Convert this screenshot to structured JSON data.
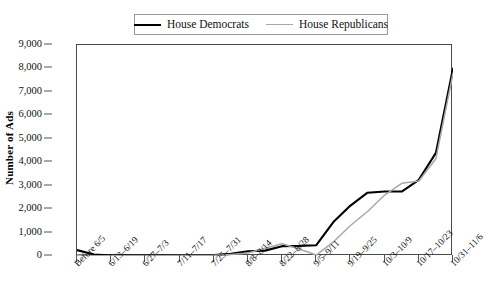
{
  "chart_data": {
    "type": "line",
    "title": "",
    "xlabel": "",
    "ylabel": "Number of Ads",
    "ylim": [
      0,
      9000
    ],
    "ytick_step": 1000,
    "grid": false,
    "legend_position": "top-center",
    "yticks": [
      "9,000",
      "8,000",
      "7,000",
      "6,000",
      "5,000",
      "4,000",
      "3,000",
      "2,000",
      "1,000",
      "0"
    ],
    "ytick_values": [
      9000,
      8000,
      7000,
      6000,
      5000,
      4000,
      3000,
      2000,
      1000,
      0
    ],
    "categories": [
      "Before 6/5",
      "6/6-6/12",
      "6/13-6/19",
      "6/20-6/26",
      "6/27-7/3",
      "7/4-7/10",
      "7/11-7/17",
      "7/18-7/24",
      "7/25-7/31",
      "8/1-8/7",
      "8/8-8/14",
      "8/15-8/21",
      "8/22-8/28",
      "8/29-9/4",
      "9/5-9/11",
      "9/12-9/18",
      "9/19-9/25",
      "9/26-10/2",
      "10/3-10/9",
      "10/10-10/16",
      "10/17-10/23",
      "10/24-10/30",
      "10/31-11/6"
    ],
    "xtick_labels": [
      "Before 6/5",
      "6/13-6/19",
      "6/27-7/3",
      "7/11-7/17",
      "7/25-7/31",
      "8/8-8/14",
      "8/22-8/28",
      "9/5-9/11",
      "9/19-9/25",
      "10/3-10/9",
      "10/17-10/23",
      "10/31-11/6"
    ],
    "xtick_indices": [
      0,
      2,
      4,
      6,
      8,
      10,
      12,
      14,
      16,
      18,
      20,
      22
    ],
    "series": [
      {
        "name": "House Democrats",
        "color": "#000000",
        "width": 2.1,
        "values": [
          250,
          60,
          20,
          15,
          15,
          20,
          25,
          30,
          40,
          90,
          200,
          230,
          420,
          430,
          460,
          1450,
          2150,
          2700,
          2750,
          2750,
          3250,
          4400,
          8000
        ]
      },
      {
        "name": "House Republicans",
        "color": "#a8a8a8",
        "width": 1.5,
        "values": [
          40,
          15,
          10,
          10,
          10,
          15,
          20,
          25,
          30,
          60,
          130,
          330,
          520,
          300,
          40,
          600,
          1300,
          1900,
          2600,
          3100,
          3200,
          4150,
          7800
        ]
      }
    ]
  },
  "legend": {
    "entries": [
      {
        "label": "House Democrats",
        "swatch": "solid-black-line"
      },
      {
        "label": "House Republicans",
        "swatch": "solid-gray-line"
      }
    ]
  },
  "axis": {
    "y_title": "Number of Ads"
  },
  "colors": {
    "democrat_line": "#000000",
    "republican_line": "#a8a8a8",
    "frame": "#4a4a4a",
    "background": "#ffffff"
  }
}
